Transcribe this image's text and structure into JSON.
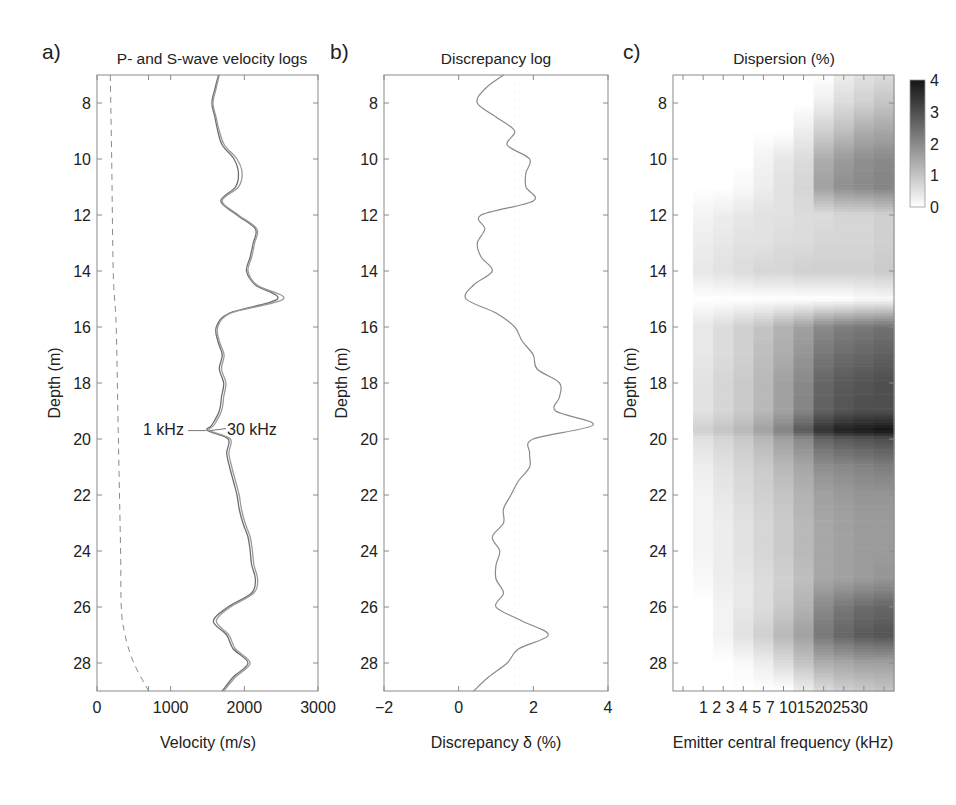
{
  "chart_data": [
    {
      "panel": "a)",
      "type": "line",
      "title": "P- and S-wave velocity logs",
      "xlabel": "Velocity (m/s)",
      "ylabel": "Depth (m)",
      "xlim": [
        0,
        3000
      ],
      "ylim": [
        29,
        7
      ],
      "xticks": [
        "0",
        "1000",
        "2000",
        "3000"
      ],
      "yticks": [
        "8",
        "10",
        "12",
        "14",
        "16",
        "18",
        "20",
        "22",
        "24",
        "26",
        "28"
      ],
      "annotations": [
        "1 kHz",
        "30 kHz"
      ],
      "series": [
        {
          "name": "P-wave 1 kHz",
          "style": "solid",
          "depth": [
            7,
            7.5,
            8,
            8.5,
            9,
            9.5,
            10,
            10.5,
            11,
            11.5,
            12,
            12.5,
            13,
            13.5,
            14,
            14.5,
            15,
            15.5,
            16,
            16.5,
            17,
            17.5,
            18,
            18.5,
            19,
            19.5,
            19.7,
            20,
            20.5,
            21,
            21.5,
            22,
            22.5,
            23,
            23.5,
            24,
            24.5,
            25,
            25.5,
            26,
            26.5,
            27,
            27.5,
            28,
            28.5,
            29
          ],
          "values": [
            1650,
            1600,
            1560,
            1600,
            1640,
            1700,
            1860,
            1920,
            1880,
            1680,
            1900,
            2150,
            2120,
            2080,
            2030,
            2150,
            2450,
            1800,
            1620,
            1640,
            1700,
            1660,
            1720,
            1690,
            1660,
            1560,
            1500,
            1780,
            1760,
            1800,
            1850,
            1900,
            1930,
            1980,
            2050,
            2080,
            2100,
            2150,
            2100,
            1780,
            1580,
            1760,
            1850,
            2050,
            1850,
            1700
          ]
        },
        {
          "name": "P-wave 30 kHz",
          "style": "solid",
          "depth": [
            7,
            7.5,
            8,
            8.5,
            9,
            9.5,
            10,
            10.5,
            11,
            11.5,
            12,
            12.5,
            13,
            13.5,
            14,
            14.5,
            15,
            15.5,
            16,
            16.5,
            17,
            17.5,
            18,
            18.5,
            19,
            19.5,
            19.7,
            20,
            20.5,
            21,
            21.5,
            22,
            22.5,
            23,
            23.5,
            24,
            24.5,
            25,
            25.5,
            26,
            26.5,
            27,
            27.5,
            28,
            28.5,
            29
          ],
          "values": [
            1660,
            1615,
            1575,
            1615,
            1660,
            1730,
            1900,
            1970,
            1920,
            1700,
            1920,
            2170,
            2140,
            2100,
            2050,
            2170,
            2530,
            1820,
            1640,
            1660,
            1725,
            1690,
            1750,
            1720,
            1690,
            1590,
            1530,
            1810,
            1790,
            1830,
            1880,
            1930,
            1960,
            2010,
            2080,
            2110,
            2130,
            2180,
            2130,
            1810,
            1620,
            1790,
            1880,
            2080,
            1880,
            1720
          ]
        },
        {
          "name": "S-wave",
          "style": "dashed",
          "depth": [
            7,
            10,
            14,
            16,
            20,
            24,
            26,
            27,
            28,
            29
          ],
          "values": [
            180,
            200,
            220,
            260,
            290,
            320,
            330,
            380,
            500,
            700
          ]
        }
      ]
    },
    {
      "panel": "b)",
      "type": "line",
      "title": "Discrepancy log",
      "xlabel": "Discrepancy δ (%)",
      "ylabel": "Depth (m)",
      "xlim": [
        -2,
        4
      ],
      "ylim": [
        29,
        7
      ],
      "xticks": [
        "−2",
        "0",
        "2",
        "4"
      ],
      "yticks": [
        "8",
        "10",
        "12",
        "14",
        "16",
        "18",
        "20",
        "22",
        "24",
        "26",
        "28"
      ],
      "series": [
        {
          "name": "Discrepancy",
          "depth": [
            7,
            7.5,
            8,
            8.5,
            9,
            9.5,
            10,
            10.5,
            11,
            11.5,
            12,
            12.5,
            13,
            13.5,
            14,
            14.5,
            15,
            15.5,
            16,
            16.5,
            17,
            17.5,
            18,
            18.5,
            19,
            19.5,
            20,
            20.5,
            21,
            21.5,
            22,
            22.5,
            23,
            23.5,
            24,
            24.5,
            25,
            25.5,
            26,
            26.5,
            27,
            27.5,
            28,
            28.5,
            29
          ],
          "values": [
            1.2,
            0.7,
            0.5,
            1.0,
            1.5,
            1.3,
            1.9,
            1.8,
            1.8,
            2.0,
            0.6,
            0.7,
            0.5,
            0.6,
            0.9,
            0.4,
            0.2,
            1.0,
            1.5,
            1.7,
            2.0,
            2.1,
            2.7,
            2.7,
            2.6,
            3.6,
            2.0,
            1.9,
            1.9,
            1.6,
            1.4,
            1.2,
            1.2,
            0.9,
            1.1,
            1.0,
            1.0,
            1.2,
            1.0,
            1.7,
            2.4,
            1.6,
            1.3,
            0.8,
            0.4
          ]
        }
      ]
    },
    {
      "panel": "c)",
      "type": "heatmap",
      "title": "Dispersion (%)",
      "xlabel": "Emitter central frequency (kHz)",
      "ylabel": "Depth (m)",
      "xticks": [
        "1",
        "2",
        "3",
        "4",
        "5",
        "7",
        "10",
        "15",
        "20",
        "25",
        "30"
      ],
      "yticks": [
        "8",
        "10",
        "12",
        "14",
        "16",
        "18",
        "20",
        "22",
        "24",
        "26",
        "28"
      ],
      "colorbar": {
        "ticks": [
          "0",
          "1",
          "2",
          "3",
          "4"
        ],
        "range": [
          0,
          4
        ],
        "cmap": "gray_r"
      },
      "x": [
        1,
        2,
        3,
        4,
        5,
        7,
        10,
        15,
        20,
        25,
        30
      ],
      "depth": [
        7,
        8,
        9,
        10,
        11,
        12,
        13,
        14,
        15,
        16,
        17,
        18,
        19,
        19.7,
        20,
        21,
        22,
        23,
        24,
        25,
        26,
        27,
        28,
        29
      ],
      "values": [
        [
          0,
          0,
          0,
          0,
          0,
          0,
          0,
          0,
          0.3,
          0.5,
          0.6
        ],
        [
          0,
          0,
          0,
          0,
          0,
          0,
          0,
          0.3,
          0.6,
          0.8,
          1.0
        ],
        [
          0,
          0,
          0,
          0,
          0,
          0,
          0.3,
          0.8,
          1.1,
          1.4,
          1.5
        ],
        [
          0,
          0,
          0,
          0,
          0.2,
          0.4,
          0.6,
          1.4,
          1.7,
          1.9,
          2.0
        ],
        [
          0,
          0,
          0,
          0.1,
          0.3,
          0.5,
          0.7,
          1.6,
          1.9,
          2.0,
          2.1
        ],
        [
          0,
          0.2,
          0.3,
          0.4,
          0.5,
          0.5,
          0.6,
          0.6,
          0.7,
          0.7,
          0.8
        ],
        [
          0,
          0.3,
          0.4,
          0.5,
          0.5,
          0.6,
          0.6,
          0.7,
          0.7,
          0.7,
          0.8
        ],
        [
          0,
          0.4,
          0.5,
          0.6,
          0.7,
          0.7,
          0.8,
          0.8,
          0.8,
          0.8,
          0.9
        ],
        [
          0,
          0,
          0,
          0,
          0,
          0,
          0,
          0,
          0,
          0.1,
          0.1
        ],
        [
          0,
          0.4,
          0.6,
          0.8,
          1.0,
          1.3,
          1.6,
          2.0,
          2.2,
          2.3,
          2.4
        ],
        [
          0,
          0.4,
          0.6,
          0.8,
          1.1,
          1.4,
          1.8,
          2.3,
          2.5,
          2.6,
          2.7
        ],
        [
          0,
          0.5,
          0.7,
          0.9,
          1.2,
          1.6,
          2.0,
          2.6,
          2.8,
          2.9,
          3.0
        ],
        [
          0,
          0.5,
          0.7,
          0.9,
          1.2,
          1.6,
          2.1,
          2.7,
          2.9,
          3.0,
          3.0
        ],
        [
          0,
          0.8,
          1.0,
          1.2,
          1.6,
          2.1,
          2.8,
          3.5,
          3.8,
          3.9,
          4.0
        ],
        [
          0,
          0.5,
          0.7,
          0.9,
          1.2,
          1.6,
          2.0,
          2.6,
          2.8,
          2.9,
          3.0
        ],
        [
          0,
          0.3,
          0.5,
          0.7,
          0.9,
          1.2,
          1.5,
          1.9,
          2.0,
          2.1,
          2.2
        ],
        [
          0,
          0.2,
          0.4,
          0.6,
          0.8,
          1.0,
          1.3,
          1.6,
          1.7,
          1.8,
          1.8
        ],
        [
          0,
          0.2,
          0.3,
          0.5,
          0.7,
          0.9,
          1.2,
          1.5,
          1.6,
          1.7,
          1.7
        ],
        [
          0,
          0.2,
          0.3,
          0.5,
          0.7,
          0.9,
          1.2,
          1.5,
          1.6,
          1.7,
          1.7
        ],
        [
          0,
          0.1,
          0.3,
          0.4,
          0.6,
          0.8,
          1.1,
          1.5,
          1.6,
          1.7,
          1.8
        ],
        [
          0,
          0,
          0.2,
          0.4,
          0.6,
          0.9,
          1.3,
          2.0,
          2.3,
          2.5,
          2.6
        ],
        [
          0,
          0,
          0.2,
          0.5,
          0.8,
          1.2,
          1.6,
          2.3,
          2.6,
          2.8,
          2.9
        ],
        [
          0,
          0,
          0,
          0.1,
          0.3,
          0.6,
          1.0,
          1.4,
          1.5,
          1.6,
          1.6
        ],
        [
          0,
          0,
          0,
          0,
          0,
          0,
          0.3,
          0.6,
          0.8,
          0.9,
          1.0
        ]
      ]
    }
  ],
  "labels": {
    "a": {
      "letter": "a)",
      "title": "P- and S-wave velocity logs",
      "xlabel": "Velocity (m/s)",
      "ylabel": "Depth (m)",
      "ann1": "1 kHz",
      "ann2": "30 kHz"
    },
    "b": {
      "letter": "b)",
      "title": "Discrepancy log",
      "xlabel": "Discrepancy δ (%)",
      "ylabel": "Depth (m)"
    },
    "c": {
      "letter": "c)",
      "title": "Dispersion (%)",
      "xlabel": "Emitter central frequency (kHz)",
      "ylabel": "Depth (m)"
    }
  }
}
